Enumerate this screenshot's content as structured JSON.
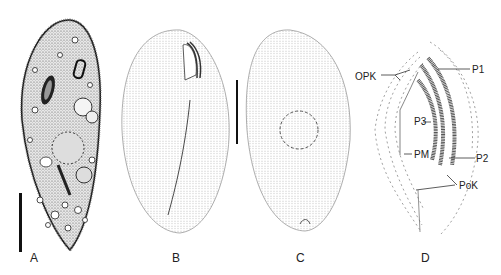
{
  "figure": {
    "panels": [
      {
        "id": "A",
        "label": "A",
        "description": "Live ciliate cell, dense cytoplasm with inclusions, macronucleus and contractile vacuoles"
      },
      {
        "id": "B",
        "label": "B",
        "description": "Ventral view, kineties and oral apparatus"
      },
      {
        "id": "C",
        "label": "C",
        "description": "Dorsal view, kineties and macronucleus outline"
      },
      {
        "id": "D",
        "label": "D",
        "description": "Oral apparatus detail"
      }
    ],
    "annotations_D": {
      "opk": "OPK",
      "p1": "P1",
      "p3": "P3",
      "pm": "PM",
      "p2": "P2",
      "pok": "PoK"
    },
    "scale_bars": [
      "scale-bar-A",
      "scale-bar-BC"
    ]
  }
}
